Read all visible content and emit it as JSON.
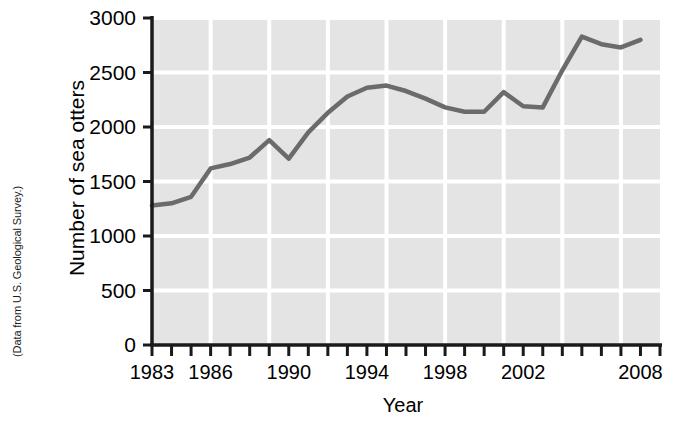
{
  "figure": {
    "source_note": "(Data from U.S. Geological Survey.)"
  },
  "chart_data": {
    "type": "line",
    "title": "",
    "xlabel": "Year",
    "ylabel": "Number of sea otters",
    "xlim": [
      1983,
      2009
    ],
    "ylim": [
      0,
      3000
    ],
    "grid": true,
    "legend": null,
    "x_tick_labels": [
      "1983",
      "1986",
      "1990",
      "1994",
      "1998",
      "2002",
      "2008"
    ],
    "x_tick_label_values": [
      1983,
      1986,
      1990,
      1994,
      1998,
      2002,
      2008
    ],
    "x_minor_tick_step": 1,
    "x_gridline_values": [
      1986,
      1989,
      1992,
      1995,
      1998,
      2001,
      2004,
      2007
    ],
    "y_tick_labels": [
      "0",
      "500",
      "1000",
      "1500",
      "2000",
      "2500",
      "3000"
    ],
    "y_tick_values": [
      0,
      500,
      1000,
      1500,
      2000,
      2500,
      3000
    ],
    "series": [
      {
        "name": "Number of sea otters",
        "color": "#6b6b6b",
        "x": [
          1983,
          1984,
          1985,
          1986,
          1987,
          1988,
          1989,
          1990,
          1991,
          1992,
          1993,
          1994,
          1995,
          1996,
          1997,
          1998,
          1999,
          2000,
          2001,
          2002,
          2003,
          2004,
          2005,
          2006,
          2007,
          2008
        ],
        "values": [
          1280,
          1300,
          1360,
          1620,
          1660,
          1720,
          1880,
          1710,
          1950,
          2130,
          2280,
          2360,
          2380,
          2330,
          2260,
          2180,
          2140,
          2140,
          2320,
          2190,
          2180,
          2520,
          2830,
          2760,
          2730,
          2800
        ]
      }
    ]
  },
  "colors": {
    "plot_background": "#e4e4e4",
    "gridline": "#ffffff",
    "axis": "#1a1a1a",
    "line": "#6b6b6b",
    "text": "#000000"
  }
}
